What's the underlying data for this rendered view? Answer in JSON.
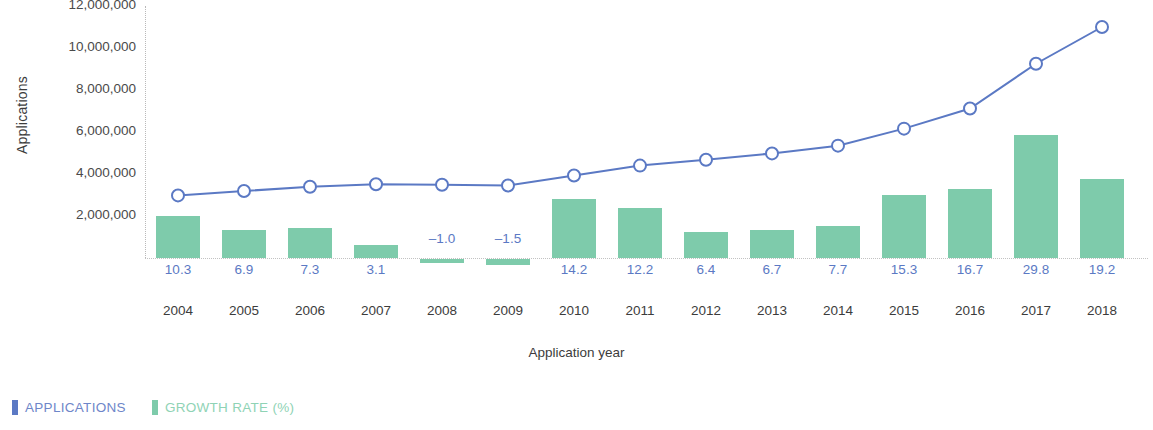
{
  "chart_data": {
    "type": "bar",
    "title": "",
    "xlabel": "Application year",
    "ylabel": "Applications",
    "categories": [
      "2004",
      "2005",
      "2006",
      "2007",
      "2008",
      "2009",
      "2010",
      "2011",
      "2012",
      "2013",
      "2014",
      "2015",
      "2016",
      "2017",
      "2018"
    ],
    "ylim": [
      0,
      12000000
    ],
    "y_ticks": [
      "2,000,000",
      "4,000,000",
      "6,000,000",
      "8,000,000",
      "10,000,000",
      "12,000,000"
    ],
    "y_tick_values": [
      2000000,
      4000000,
      6000000,
      8000000,
      10000000,
      12000000
    ],
    "grid": false,
    "legend_position": "bottom-left",
    "series": [
      {
        "name": "APPLICATIONS",
        "type": "line",
        "color": "#5B79C4",
        "marker": "open-circle",
        "axis": "left",
        "values": [
          2980000,
          3190000,
          3390000,
          3510000,
          3490000,
          3450000,
          3930000,
          4400000,
          4680000,
          4980000,
          5350000,
          6160000,
          7120000,
          9250000,
          11000000
        ]
      },
      {
        "name": "GROWTH RATE (%)",
        "type": "bar",
        "color": "#7ECBAB",
        "axis": "right",
        "values": [
          10.3,
          6.9,
          7.3,
          3.1,
          -1.0,
          -1.5,
          14.2,
          12.2,
          6.4,
          6.7,
          7.7,
          15.3,
          16.7,
          29.8,
          19.2
        ],
        "data_labels": [
          "10.3",
          "6.9",
          "7.3",
          "3.1",
          "-1.0",
          "-1.5",
          "14.2",
          "12.2",
          "6.4",
          "6.7",
          "7.7",
          "15.3",
          "16.7",
          "29.8",
          "19.2"
        ]
      }
    ]
  },
  "axes": {
    "y_title": "Applications",
    "x_title": "Application year"
  },
  "legend": {
    "items": [
      {
        "label": "APPLICATIONS",
        "color": "#5B79C4"
      },
      {
        "label": "GROWTH RATE (%)",
        "color": "#7ECBAB"
      }
    ]
  }
}
